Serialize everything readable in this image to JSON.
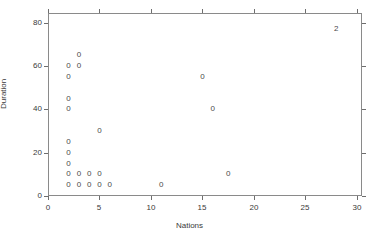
{
  "chart_data": {
    "type": "scatter",
    "title": "",
    "xlabel": "Nations",
    "ylabel": "Duration",
    "xlim": [
      0,
      30.5
    ],
    "ylim": [
      0,
      84.5
    ],
    "xticks": [
      0,
      5,
      10,
      15,
      20,
      25,
      30
    ],
    "xticklabels": [
      "0",
      "5",
      "10",
      "15",
      "20",
      "25",
      "30"
    ],
    "yticks": [
      0,
      20,
      40,
      60,
      80
    ],
    "yticklabels": [
      "0",
      "20",
      "40",
      "60",
      "80"
    ],
    "grid": false,
    "legend": null,
    "marker_glyph": "0",
    "marker_note": "Each plotted glyph is the digit count of coincident observations; '0' denotes a single/zero-coded point, '2' denotes two overlapping points.",
    "points": [
      {
        "x": 3,
        "y": 65,
        "label": "0"
      },
      {
        "x": 2,
        "y": 60,
        "label": "0"
      },
      {
        "x": 3,
        "y": 60,
        "label": "0"
      },
      {
        "x": 2,
        "y": 55,
        "label": "0"
      },
      {
        "x": 2,
        "y": 45,
        "label": "0"
      },
      {
        "x": 2,
        "y": 40,
        "label": "0"
      },
      {
        "x": 5,
        "y": 30,
        "label": "0"
      },
      {
        "x": 2,
        "y": 25,
        "label": "0"
      },
      {
        "x": 2,
        "y": 20,
        "label": "0"
      },
      {
        "x": 2,
        "y": 15,
        "label": "0"
      },
      {
        "x": 2,
        "y": 10,
        "label": "0"
      },
      {
        "x": 3,
        "y": 10,
        "label": "0"
      },
      {
        "x": 4,
        "y": 10,
        "label": "0"
      },
      {
        "x": 5,
        "y": 10,
        "label": "0"
      },
      {
        "x": 2,
        "y": 5,
        "label": "0"
      },
      {
        "x": 3,
        "y": 5,
        "label": "0"
      },
      {
        "x": 4,
        "y": 5,
        "label": "0"
      },
      {
        "x": 5,
        "y": 5,
        "label": "0"
      },
      {
        "x": 6,
        "y": 5,
        "label": "0"
      },
      {
        "x": 11,
        "y": 5,
        "label": "0"
      },
      {
        "x": 15,
        "y": 55,
        "label": "0"
      },
      {
        "x": 16,
        "y": 40,
        "label": "0"
      },
      {
        "x": 17.5,
        "y": 10,
        "label": "0"
      },
      {
        "x": 28,
        "y": 77,
        "label": "2"
      }
    ],
    "colors": {
      "axis": "#8a8a8a",
      "tick": "#6e6e6e",
      "text": "#3a3a3a",
      "marker": "#4a4a4a",
      "background": "#ffffff"
    }
  }
}
